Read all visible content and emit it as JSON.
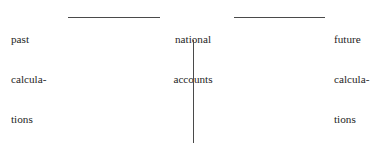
{
  "diagram": {
    "type": "timeline-axis",
    "background_color": "#ffffff",
    "stroke_color": "#4a4a4a",
    "text_color": "#262626",
    "nodes": [
      {
        "id": "past",
        "position": "left",
        "lines": [
          "past",
          "calcula-",
          "tions"
        ],
        "full_text": "past calculations"
      },
      {
        "id": "center",
        "position": "center",
        "lines": [
          "national",
          "accounts"
        ],
        "full_text": "national accounts"
      },
      {
        "id": "future",
        "position": "right",
        "lines": [
          "future",
          "calcula-",
          "tions"
        ],
        "full_text": "future calculations"
      }
    ],
    "connectors": [
      {
        "id": "past-to-center",
        "orientation": "horizontal",
        "from": "past",
        "to": "center"
      },
      {
        "id": "center-to-future",
        "orientation": "horizontal",
        "from": "center",
        "to": "future"
      },
      {
        "id": "center-stem",
        "orientation": "vertical",
        "from": "center",
        "to": ""
      }
    ]
  }
}
